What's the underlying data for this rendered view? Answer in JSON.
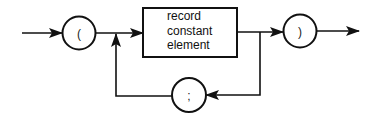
{
  "diagram": {
    "type": "syntax-diagram",
    "start_terminal": {
      "symbol": "("
    },
    "nonterminal_box": {
      "lines": [
        "record",
        "constant",
        "element"
      ]
    },
    "end_terminal": {
      "symbol": ")"
    },
    "loop_terminal": {
      "symbol": ";"
    },
    "colors": {
      "stroke": "#111111",
      "background": "#ffffff"
    }
  }
}
